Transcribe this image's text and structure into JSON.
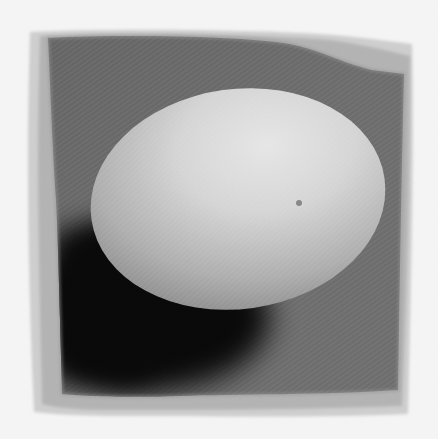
{
  "image": {
    "subject": "egg",
    "style": "black-and-white photograph with distressed ragged frame border",
    "alt": "A single white egg resting on a dark textured cloth surface, casting a deep shadow to the lower left"
  },
  "colors": {
    "background": "#ffffff",
    "frame_outer": "#c8c8c8",
    "frame_inner": "#a6a6a6",
    "surface": "#6a6a6a",
    "surface_dark": "#555555",
    "shadow": "#080808",
    "egg_highlight": "#ececec",
    "egg_mid": "#cfcfcf",
    "egg_shade": "#8f8f8f",
    "speckle": "#8a8a8a"
  }
}
